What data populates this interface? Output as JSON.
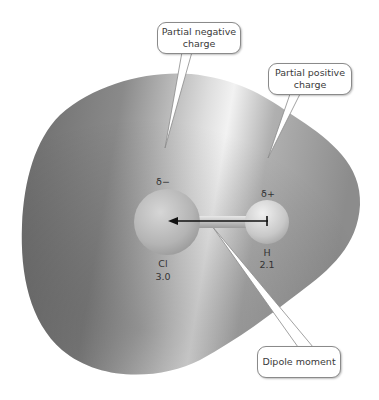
{
  "callouts": {
    "partial_negative": {
      "line1": "Partial negative",
      "line2": "charge"
    },
    "partial_positive": {
      "line1": "Partial positive",
      "line2": "charge"
    },
    "dipole_moment": {
      "label": "Dipole moment"
    }
  },
  "charges": {
    "negative_symbol": "δ−",
    "positive_symbol": "δ+"
  },
  "atoms": [
    {
      "symbol": "Cl",
      "electronegativity": "3.0"
    },
    {
      "symbol": "H",
      "electronegativity": "2.1"
    }
  ],
  "colors": {
    "electron_cloud_dark": "#6e6e6e",
    "electron_cloud_light": "#dcdcdc",
    "atom_fill": "#c4c4c4",
    "arrow": "#111111",
    "bubble_border": "#8a8a8a"
  }
}
